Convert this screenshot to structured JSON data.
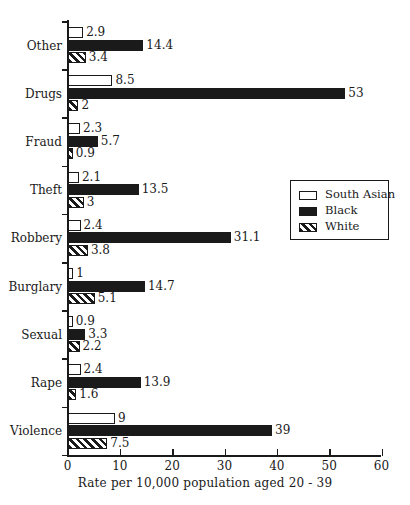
{
  "chart_data": {
    "type": "bar",
    "orientation": "horizontal",
    "title": "",
    "subtitle": "",
    "xlabel": "Rate per 10,000 population aged 20 - 39",
    "ylabel": "",
    "xlim": [
      0,
      60
    ],
    "xticks": [
      0,
      10,
      20,
      30,
      40,
      50,
      60
    ],
    "xtick_labels": [
      "0",
      "10",
      "20",
      "30",
      "40",
      "50",
      "60"
    ],
    "grid": false,
    "categories": [
      "Other",
      "Drugs",
      "Fraud",
      "Theft",
      "Robbery",
      "Burglary",
      "Sexual",
      "Rape",
      "Violence"
    ],
    "series": [
      {
        "name": "South Asian",
        "fill": "white",
        "values": [
          2.9,
          8.5,
          2.3,
          2.1,
          2.4,
          1,
          0.9,
          2.4,
          9
        ],
        "labels": [
          "2.9",
          "8.5",
          "2.3",
          "2.1",
          "2.4",
          "1",
          "0.9",
          "2.4",
          "9"
        ]
      },
      {
        "name": "Black",
        "fill": "solid-black",
        "values": [
          14.4,
          53,
          5.7,
          13.5,
          31.1,
          14.7,
          3.3,
          13.9,
          39
        ],
        "labels": [
          "14.4",
          "53",
          "5.7",
          "13.5",
          "31.1",
          "14.7",
          "3.3",
          "13.9",
          "39"
        ]
      },
      {
        "name": "White",
        "fill": "diagonal-hatch",
        "values": [
          3.4,
          2,
          0.9,
          3,
          3.8,
          5.1,
          2.2,
          1.6,
          7.5
        ],
        "labels": [
          "3.4",
          "2",
          "0.9",
          "3",
          "3.8",
          "5.1",
          "2.2",
          "1.6",
          "7.5"
        ]
      }
    ],
    "legend": {
      "position": "right-upper-middle",
      "entries": [
        {
          "label": "South Asian",
          "fill": "white"
        },
        {
          "label": "Black",
          "fill": "solid-black"
        },
        {
          "label": "White",
          "fill": "diagonal-hatch"
        }
      ]
    },
    "colors": {
      "ink": "#1a1a1a",
      "background": "#ffffff"
    }
  }
}
